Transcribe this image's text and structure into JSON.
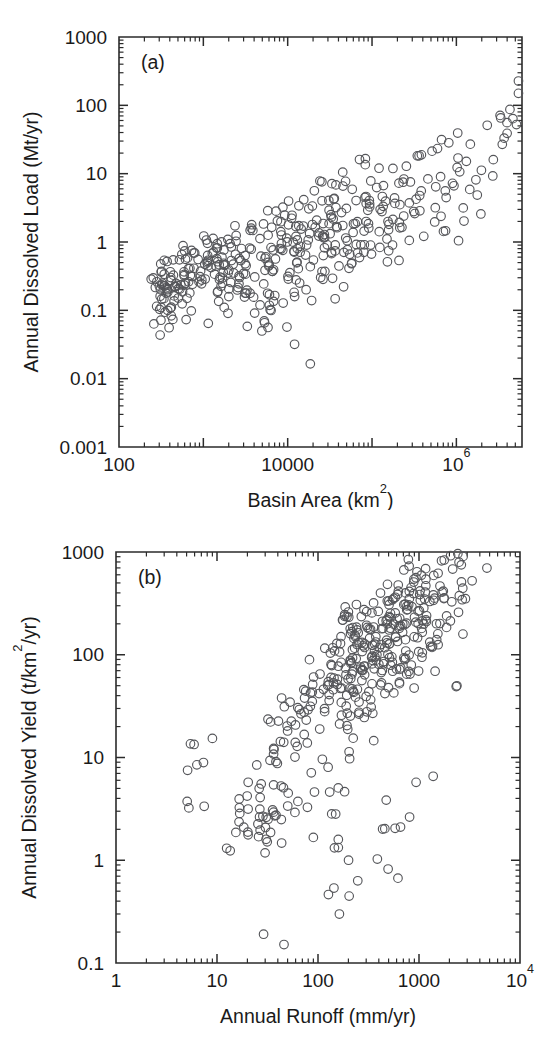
{
  "figure": {
    "background": "#ffffff",
    "marker_color": "#55565a",
    "axis_color": "#2b2b2b"
  },
  "chart_data": [
    {
      "type": "scatter",
      "panel_label": "(a)",
      "title": "",
      "xlabel": "Basin Area (km2)",
      "xlabel_base": "Basin Area (km",
      "xlabel_sup": "2",
      "xlabel_tail": ")",
      "ylabel": "Annual Dissolved Load (Mt/yr)",
      "xscale": "log",
      "yscale": "log",
      "xlim": [
        100,
        6000000
      ],
      "ylim": [
        0.001,
        1000
      ],
      "grid": false,
      "legend": "none",
      "xticks": [
        100,
        10000,
        1000000
      ],
      "xticklabels": [
        "100",
        "10000",
        "10^6"
      ],
      "xminorticks": [
        1000,
        100000
      ],
      "yticks": [
        0.001,
        0.01,
        0.1,
        1,
        10,
        100,
        1000
      ],
      "yticklabels": [
        "0.001",
        "0.01",
        "0.1",
        "1",
        "10",
        "100",
        "1000"
      ],
      "n_points": 430,
      "x": [
        310,
        330,
        345,
        355,
        360,
        370,
        380,
        390,
        400,
        410,
        420,
        430,
        440,
        450,
        465,
        480,
        500,
        520,
        540,
        560,
        600,
        640,
        680,
        700,
        750,
        800,
        850,
        900,
        950,
        1000,
        1100,
        1150,
        1200,
        1250,
        1300,
        1400,
        1500,
        1600,
        1700,
        1800,
        1900,
        2000,
        2100,
        2200,
        2400,
        2500,
        2600,
        2800,
        3000,
        3200,
        3400,
        3600,
        3800,
        4000,
        4200,
        4500,
        4800,
        5000,
        5200,
        5500,
        5800,
        6000,
        6400,
        6800,
        7000,
        7500,
        8000,
        8500,
        9000,
        9500,
        10000,
        10500,
        11000,
        11500,
        12000,
        12500,
        13000,
        13500,
        14000,
        15000,
        16000,
        17000,
        18000,
        19000,
        20000,
        21000,
        22000,
        23000,
        24000,
        25000,
        26000,
        28000,
        30000,
        32000,
        34000,
        36000,
        38000,
        40000,
        42000,
        45000,
        48000,
        50000,
        52000,
        55000,
        58000,
        60000,
        65000,
        70000,
        75000,
        80000,
        85000,
        90000,
        95000,
        100000,
        110000,
        120000,
        130000,
        140000,
        150000,
        160000,
        170000,
        180000,
        190000,
        200000,
        220000,
        240000,
        260000,
        280000,
        300000,
        320000,
        350000,
        380000,
        400000,
        450000,
        500000,
        550000,
        600000,
        650000,
        700000,
        800000,
        900000,
        1000000,
        1100000,
        1200000,
        1400000,
        1600000,
        1800000,
        2000000,
        2400000,
        2800000,
        3200000,
        3600000,
        4000000,
        4500000,
        5000000,
        5500000
      ],
      "y": [
        0.21,
        0.19,
        0.26,
        0.11,
        0.05,
        0.24,
        0.14,
        0.3,
        0.18,
        0.22,
        0.12,
        0.28,
        0.16,
        0.1,
        0.25,
        0.2,
        0.27,
        0.13,
        0.23,
        0.17,
        0.55,
        0.42,
        0.7,
        0.35,
        0.6,
        0.48,
        0.8,
        0.3,
        0.65,
        0.52,
        0.9,
        0.4,
        0.25,
        0.58,
        0.16,
        0.75,
        0.22,
        0.95,
        0.33,
        0.12,
        0.68,
        0.45,
        0.18,
        0.85,
        0.29,
        1.1,
        0.38,
        0.2,
        0.62,
        0.15,
        1.3,
        0.5,
        0.08,
        0.78,
        0.26,
        1.0,
        0.34,
        0.06,
        0.56,
        0.19,
        1.5,
        0.44,
        0.09,
        0.88,
        0.31,
        1.8,
        0.6,
        0.13,
        1.05,
        0.39,
        2.2,
        0.72,
        0.17,
        1.25,
        0.48,
        2.8,
        0.85,
        0.03,
        1.45,
        0.55,
        3.0,
        1.0,
        0.21,
        1.7,
        0.63,
        3.5,
        1.15,
        0.27,
        1.95,
        0.74,
        4.2,
        1.35,
        0.33,
        2.3,
        0.86,
        5.0,
        1.6,
        0.4,
        2.7,
        1.0,
        6.0,
        1.85,
        0.48,
        3.2,
        1.2,
        7.0,
        2.2,
        0.58,
        3.8,
        1.4,
        8.5,
        2.6,
        0.68,
        4.5,
        1.65,
        10.0,
        3.1,
        0.8,
        5.3,
        1.95,
        12.0,
        3.7,
        0.95,
        6.2,
        2.3,
        14.0,
        4.4,
        1.15,
        7.4,
        2.75,
        17.0,
        5.2,
        1.35,
        8.8,
        3.3,
        20.0,
        6.2,
        1.6,
        10.5,
        4.0,
        25.0,
        7.5,
        2.0,
        13.0,
        5.0,
        32.0,
        9.5,
        2.6,
        45.0,
        16.0,
        60.0,
        28.0,
        90.0,
        50.0,
        140.0,
        250.0
      ],
      "cluster_notes": "Points form a broad positively-correlated band: small basins (~300 km2) carry loads near 0.1-0.3 Mt/yr; the largest basins (>10^6 km2) reach 100-250 Mt/yr. Scatter spans roughly 2 orders of magnitude at any given area, with low outliers near 0.01-0.03 Mt/yr around 10^4 km2."
    },
    {
      "type": "scatter",
      "panel_label": "(b)",
      "title": "",
      "xlabel": "Annual Runoff (mm/yr)",
      "ylabel": "Annual Dissolved Yield (t/km2/yr)",
      "ylabel_base": "Annual Dissolved Yield (t/km",
      "ylabel_sup": "2",
      "ylabel_tail": "/yr)",
      "xscale": "log",
      "yscale": "log",
      "xlim": [
        1,
        10000
      ],
      "ylim": [
        0.1,
        1000
      ],
      "grid": false,
      "legend": "none",
      "xticks": [
        1,
        10,
        100,
        1000,
        10000
      ],
      "xticklabels": [
        "1",
        "10",
        "100",
        "1000",
        "10^4"
      ],
      "yticks": [
        0.1,
        1,
        10,
        100,
        1000
      ],
      "yticklabels": [
        "0.1",
        "1",
        "10",
        "100",
        "1000"
      ],
      "n_points": 430,
      "x": [
        7,
        7.5,
        8,
        18,
        19,
        20,
        21,
        24,
        26,
        28,
        29,
        30,
        31,
        32,
        33,
        34,
        36,
        38,
        40,
        44,
        48,
        52,
        55,
        58,
        62,
        66,
        70,
        74,
        78,
        82,
        86,
        90,
        95,
        100,
        105,
        110,
        115,
        120,
        125,
        130,
        135,
        140,
        145,
        150,
        155,
        160,
        165,
        170,
        175,
        180,
        185,
        190,
        195,
        200,
        205,
        210,
        215,
        220,
        225,
        230,
        235,
        240,
        245,
        250,
        255,
        260,
        265,
        270,
        275,
        280,
        285,
        290,
        295,
        300,
        310,
        320,
        330,
        340,
        350,
        360,
        370,
        380,
        390,
        400,
        410,
        420,
        430,
        440,
        450,
        460,
        470,
        480,
        490,
        500,
        510,
        520,
        530,
        540,
        550,
        560,
        575,
        590,
        605,
        620,
        635,
        650,
        665,
        680,
        695,
        710,
        725,
        740,
        755,
        770,
        785,
        800,
        820,
        840,
        860,
        880,
        900,
        920,
        940,
        960,
        980,
        1000,
        1030,
        1060,
        1090,
        1120,
        1150,
        1180,
        1210,
        1250,
        1290,
        1330,
        1370,
        1410,
        1450,
        1500,
        1550,
        1600,
        1650,
        1700,
        1750,
        1800,
        1870,
        1940,
        2010,
        2080,
        2150,
        2250,
        2350,
        2450,
        2600,
        2800,
        3000,
        3200
      ],
      "y": [
        9.5,
        3.2,
        9.0,
        4.0,
        1.9,
        1.8,
        5.0,
        4.8,
        3.0,
        2.6,
        2.2,
        2.0,
        1.6,
        0.17,
        2.4,
        3.0,
        7.8,
        2.8,
        8.0,
        16.0,
        18.0,
        20.0,
        15.0,
        12.0,
        22.0,
        25.0,
        17.0,
        30.0,
        35.0,
        2.8,
        40.0,
        95.0,
        45.0,
        5.5,
        28.0,
        60.0,
        33.0,
        70.0,
        8.0,
        50.0,
        3.0,
        85.0,
        38.0,
        110.0,
        1.6,
        55.0,
        22.0,
        130.0,
        65.0,
        0.52,
        42.0,
        150.0,
        75.0,
        18.0,
        95.0,
        1.0,
        48.0,
        170.0,
        80.0,
        30.0,
        120.0,
        58.0,
        200.0,
        88.0,
        35.0,
        140.0,
        68.0,
        230.0,
        100.0,
        25.0,
        160.0,
        78.0,
        260.0,
        115.0,
        44.0,
        185.0,
        90.0,
        300.0,
        130.0,
        52.0,
        210.0,
        100.0,
        340.0,
        145.0,
        60.0,
        240.0,
        115.0,
        2.1,
        165.0,
        70.0,
        270.0,
        0.76,
        130.0,
        520.0,
        185.0,
        80.0,
        300.0,
        145.0,
        2.0,
        210.0,
        90.0,
        340.0,
        165.0,
        62.0,
        235.0,
        100.0,
        380.0,
        185.0,
        72.0,
        265.0,
        112.0,
        430.0,
        205.0,
        82.0,
        295.0,
        125.0,
        480.0,
        230.0,
        92.0,
        330.0,
        140.0,
        540.0,
        255.0,
        105.0,
        370.0,
        155.0,
        600.0,
        285.0,
        118.0,
        415.0,
        175.0,
        660.0,
        320.0,
        132.0,
        465.0,
        195.0,
        7.8,
        355.0,
        148.0,
        520.0,
        220.0,
        700.0,
        395.0,
        165.0,
        580.0,
        245.0,
        740.0,
        440.0,
        185.0,
        640.0,
        275.0,
        760.0,
        490.0,
        42.0,
        700.0,
        310.0,
        780.0,
        560.0
      ],
      "cluster_notes": "Dense positively-correlated cloud. Below 40 mm/yr runoff, yields are low and sparse (0.2-10 t/km2/yr). Between 100-1000 mm/yr the bulk sits at 10-200 t/km2/yr, and above 2000 mm/yr yields reach 300-800 t/km2/yr. A few low outliers near 0.5-2 t/km2/yr occur at 150-500 mm/yr."
    }
  ]
}
